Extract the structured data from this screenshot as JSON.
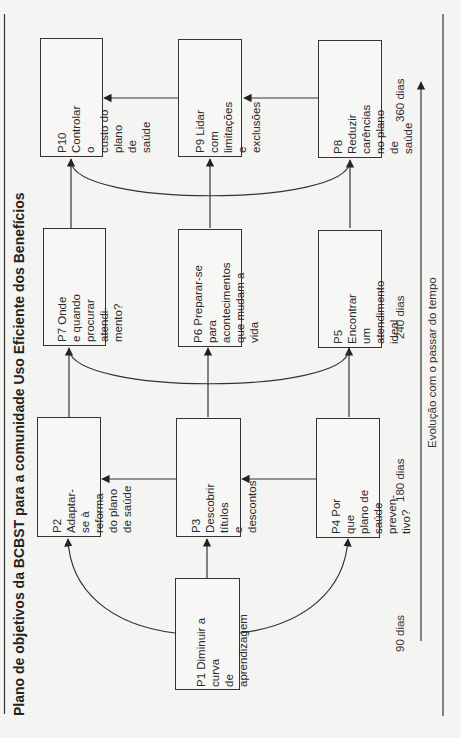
{
  "title": "Plano de objetivos da BCBST para a comunidade Uso Eficiente dos Benefícios",
  "boxes": {
    "p1": "P1 Diminuir a curva\nde aprendizagem",
    "p2": "P2 Adaptar-se à\nreforma do plano\nde saúde",
    "p3": "P3 Descobrir títulos\ne descontos",
    "p4": "P4 Por que plano de\nsaúde preven-\ntivo?",
    "p5": "P5 Encontrar um\natendimento\nideal",
    "p6": "P6 Preparar-se para\nacontecimentos\nque mudam a vida",
    "p7": "P7 Onde e quando\nprocurar atendi-\nmento?",
    "p8": "P8 Reduzir carências\nno plano de\nsaúde",
    "p9": "P9 Lidar com\nlimitações e\nexclusões",
    "p10": "P10 Controlar o\ncusto do plano\nde saúde"
  },
  "timeline": {
    "labels": [
      "90 dias",
      "180 dias",
      "240 dias",
      "360 dias"
    ],
    "axis_label": "Evolução com o passar do tempo"
  },
  "colors": {
    "line": "#333333",
    "background": "#f4f4f2"
  }
}
